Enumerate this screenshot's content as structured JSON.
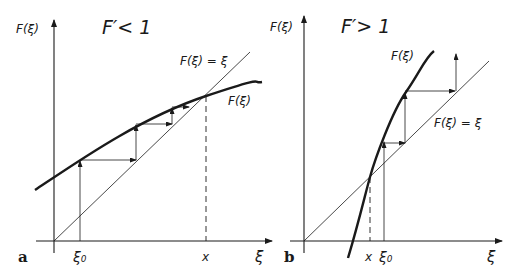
{
  "figure": {
    "panels": [
      {
        "id": "a",
        "panel_label": "a",
        "condition": "F′< 1",
        "y_axis_label": "F(ξ)",
        "x_axis_label": "ξ",
        "diagonal_label": "F(ξ) = ξ",
        "curve_label": "F(ξ)",
        "start_label": "ξ₀",
        "fixed_point_label": "x",
        "behavior": "iteration converges to fixed point x"
      },
      {
        "id": "b",
        "panel_label": "b",
        "condition": "F′> 1",
        "y_axis_label": "F(ξ)",
        "x_axis_label": "ξ",
        "diagonal_label": "F(ξ) = ξ",
        "curve_label": "F(ξ)",
        "start_label": "ξ₀",
        "fixed_point_label": "x",
        "behavior": "iteration diverges from fixed point x"
      }
    ],
    "colors": {
      "ink": "#1a1a1a",
      "background": "#ffffff"
    }
  }
}
